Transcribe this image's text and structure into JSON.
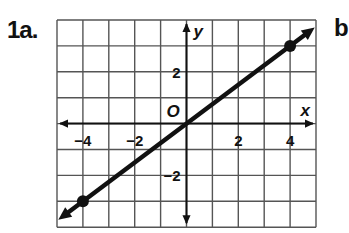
{
  "labels": {
    "problem": "1a.",
    "next_problem": "b"
  },
  "chart_data": {
    "type": "line",
    "title": "",
    "xlabel": "x",
    "ylabel": "y",
    "origin_label": "O",
    "xlim": [
      -5,
      5
    ],
    "ylim": [
      -4,
      4
    ],
    "grid": true,
    "grid_step": 1,
    "x_ticks": [
      {
        "value": -4,
        "label": "−4"
      },
      {
        "value": -2,
        "label": "−2"
      },
      {
        "value": 2,
        "label": "2"
      },
      {
        "value": 4,
        "label": "4"
      }
    ],
    "y_ticks": [
      {
        "value": 2,
        "label": "2"
      },
      {
        "value": -2,
        "label": "−2"
      }
    ],
    "series": [
      {
        "name": "line",
        "equation": "y = 0.75x",
        "slope": 0.75,
        "intercept": 0,
        "extends_both_directions": true,
        "points": [
          {
            "x": -4,
            "y": -3
          },
          {
            "x": 4,
            "y": 3
          }
        ]
      }
    ],
    "line_color": "#111111",
    "grid_color": "#555555"
  }
}
